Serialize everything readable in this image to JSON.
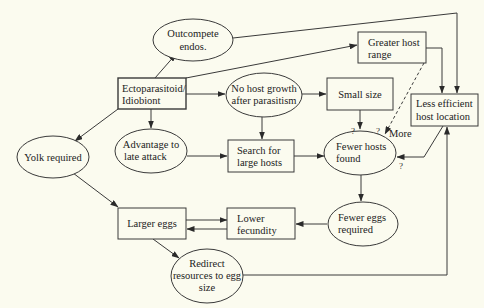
{
  "diagram": {
    "type": "flowchart",
    "colors": {
      "background": "#fbfbef",
      "stroke": "#3a3a3a",
      "text": "#222222"
    },
    "nodes": {
      "outcompete": {
        "shape": "ellipse",
        "lines": [
          "Outcompete",
          "endos."
        ]
      },
      "ecto": {
        "shape": "box",
        "lines": [
          "Ectoparasitoid/",
          "Idiobiont"
        ]
      },
      "nogrowth": {
        "shape": "ellipse",
        "lines": [
          "No host growth",
          "after parasitism"
        ]
      },
      "greater": {
        "shape": "box",
        "lines": [
          "Greater host",
          "range"
        ]
      },
      "smallsize": {
        "shape": "box",
        "lines": [
          "Small size"
        ]
      },
      "lessefficient": {
        "shape": "box",
        "lines": [
          "Less efficient",
          "host location"
        ]
      },
      "yolk": {
        "shape": "ellipse",
        "lines": [
          "Yolk required"
        ]
      },
      "advantage": {
        "shape": "ellipse",
        "lines": [
          "Advantage to",
          "late attack"
        ]
      },
      "search": {
        "shape": "box",
        "lines": [
          "Search for",
          "large hosts"
        ]
      },
      "fewerhosts": {
        "shape": "ellipse",
        "lines": [
          "Fewer hosts",
          "found"
        ]
      },
      "largereggs": {
        "shape": "box",
        "lines": [
          "Larger eggs"
        ]
      },
      "lowerfec": {
        "shape": "box",
        "lines": [
          "Lower",
          "fecundity"
        ]
      },
      "fewereggs": {
        "shape": "ellipse",
        "lines": [
          "Fewer eggs",
          "required"
        ]
      },
      "redirect": {
        "shape": "ellipse",
        "lines": [
          "Redirect",
          "resources to egg",
          "size"
        ]
      }
    },
    "edge_labels": {
      "q_smallsize": "?",
      "q_dashed": "?",
      "more": "More",
      "q_lessefficient": "?"
    },
    "edges": [
      {
        "from": "ecto",
        "to": "outcompete"
      },
      {
        "from": "ecto",
        "to": "nogrowth"
      },
      {
        "from": "ecto",
        "to": "greater"
      },
      {
        "from": "ecto",
        "to": "yolk"
      },
      {
        "from": "ecto",
        "to": "advantage"
      },
      {
        "from": "outcompete",
        "to": "lessefficient"
      },
      {
        "from": "nogrowth",
        "to": "smallsize"
      },
      {
        "from": "nogrowth",
        "to": "search"
      },
      {
        "from": "greater",
        "to": "lessefficient"
      },
      {
        "from": "greater",
        "to": "fewerhosts",
        "style": "dashed",
        "label": "More"
      },
      {
        "from": "smallsize",
        "to": "fewerhosts",
        "label": "?"
      },
      {
        "from": "lessefficient",
        "to": "fewerhosts",
        "label": "?"
      },
      {
        "from": "advantage",
        "to": "search"
      },
      {
        "from": "search",
        "to": "fewerhosts"
      },
      {
        "from": "fewerhosts",
        "to": "fewereggs"
      },
      {
        "from": "fewereggs",
        "to": "lowerfec"
      },
      {
        "from": "yolk",
        "to": "largereggs"
      },
      {
        "from": "largereggs",
        "to": "lowerfec"
      },
      {
        "from": "lowerfec",
        "to": "largereggs"
      },
      {
        "from": "largereggs",
        "to": "redirect"
      },
      {
        "from": "redirect",
        "to": "lessefficient"
      }
    ]
  }
}
